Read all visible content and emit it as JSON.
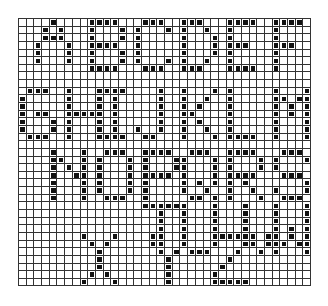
{
  "grid": {
    "cols": 38,
    "rows": 35,
    "line_color": "#333333",
    "dot_color": "#111111"
  },
  "text_lines": [
    "ABCDEF",
    "GHIJKLM",
    "NOPQRS",
    "TUVW",
    "XYZ"
  ],
  "letters": [
    {
      "ch": "A",
      "col": 2,
      "row": 0
    },
    {
      "ch": "B",
      "col": 9,
      "row": 0
    },
    {
      "ch": "C",
      "col": 15,
      "row": 0
    },
    {
      "ch": "D",
      "col": 21,
      "row": 0
    },
    {
      "ch": "E",
      "col": 27,
      "row": 0
    },
    {
      "ch": "F",
      "col": 33,
      "row": 0
    },
    {
      "ch": "G",
      "col": 0,
      "row": 9
    },
    {
      "ch": "H",
      "col": 6,
      "row": 9
    },
    {
      "ch": "I",
      "col": 11,
      "row": 9
    },
    {
      "ch": "J",
      "col": 15,
      "row": 9
    },
    {
      "ch": "K",
      "col": 21,
      "row": 9
    },
    {
      "ch": "L",
      "col": 27,
      "row": 9
    },
    {
      "ch": "M",
      "col": 33,
      "row": 9
    },
    {
      "ch": "N",
      "col": 4,
      "row": 17
    },
    {
      "ch": "O",
      "col": 10,
      "row": 17
    },
    {
      "ch": "P",
      "col": 16,
      "row": 17
    },
    {
      "ch": "Q",
      "col": 21,
      "row": 17
    },
    {
      "ch": "R",
      "col": 27,
      "row": 17
    },
    {
      "ch": "S",
      "col": 33,
      "row": 17
    },
    {
      "ch": "T",
      "col": 16,
      "row": 24
    },
    {
      "ch": "U",
      "col": 21,
      "row": 24
    },
    {
      "ch": "V",
      "col": 29,
      "row": 24
    },
    {
      "ch": "W",
      "col": 33,
      "row": 24
    },
    {
      "ch": "X",
      "col": 8,
      "row": 28
    },
    {
      "ch": "Y",
      "col": 17,
      "row": 28
    },
    {
      "ch": "Z",
      "col": 25,
      "row": 28
    }
  ]
}
